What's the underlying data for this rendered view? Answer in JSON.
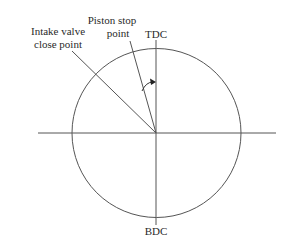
{
  "diagram": {
    "labels": {
      "intake_line1": "Intake valve",
      "intake_line2": "close point",
      "piston_line1": "Piston stop",
      "piston_line2": "point",
      "tdc": "TDC",
      "bdc": "BDC"
    },
    "colors": {
      "line": "#3a3a3a",
      "text": "#2a2a2a"
    }
  }
}
